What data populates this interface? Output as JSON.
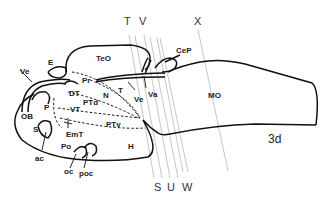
{
  "diagram": {
    "stage_label": "3d",
    "section_lines": [
      {
        "id": "T",
        "label": "T"
      },
      {
        "id": "V",
        "label": "V"
      },
      {
        "id": "X",
        "label": "X"
      },
      {
        "id": "S",
        "label": "S"
      },
      {
        "id": "U",
        "label": "U"
      },
      {
        "id": "W",
        "label": "W"
      }
    ],
    "regions": {
      "TeO": "TeO",
      "CeP": "CeP",
      "MO": "MO",
      "Ve_top": "Ve",
      "E": "E",
      "Pr": "Pr",
      "DT": "DT",
      "N": "N",
      "PTd": "PTd",
      "T": "T",
      "Ve_mid": "Ve",
      "Va": "Va",
      "OB": "OB",
      "P": "P",
      "VT": "VT",
      "S": "S",
      "EmT": "EmT",
      "PTv": "PTv",
      "Po": "Po",
      "H": "H",
      "ac": "ac",
      "oc": "oc",
      "poc": "poc"
    },
    "colors": {
      "outline": "#111111",
      "section_line": "#b8b8b8",
      "text": "#222222"
    }
  }
}
